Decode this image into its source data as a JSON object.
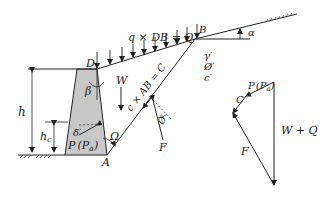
{
  "diagram": {
    "labels": {
      "surcharge": "q × DB = Q",
      "point_D": "D",
      "point_B": "B",
      "point_A": "A",
      "alpha": "α",
      "beta": "β",
      "weight": "W",
      "cohesion_force": "c × AB = C",
      "gamma": "γ′",
      "phi": "Ø′",
      "c_prime": "c′",
      "phi_on_F": "Ø′",
      "F": "F",
      "omega": "Ω",
      "delta": "δ′",
      "h": "h",
      "h_c": "h",
      "h_c_sub": "c",
      "P": "P",
      "P_a": "(P",
      "P_a_sub": "a",
      "P_a_close": ")"
    },
    "force_polygon": {
      "C": "C",
      "P": "P",
      "P_a": "(P",
      "P_a_sub": "a",
      "P_a_close": ")",
      "W_plus_Q": "W + Q",
      "F": "F"
    },
    "colors": {
      "line": "#222222",
      "wall_fill": "#c8c8c8"
    }
  }
}
